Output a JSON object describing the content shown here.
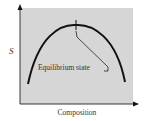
{
  "figure": {
    "y_axis_label": "S",
    "x_axis_label": "Composition",
    "annotation_label": "Equilibrium state",
    "colors": {
      "plot_background": "#d6d6d6",
      "curve": "#111111",
      "axis": "#222222",
      "text": "#333333"
    }
  },
  "diagram": {
    "type": "curve-schematic",
    "curve_shape": "inverted-parabola",
    "marked_point": "maximum",
    "marked_point_label": "Equilibrium state"
  }
}
